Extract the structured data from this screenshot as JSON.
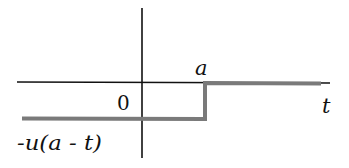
{
  "diagram": {
    "title": "",
    "function_label": "-u(a - t)",
    "origin_label": "0",
    "step_label": "a",
    "x_axis_label": "t",
    "colors": {
      "axis": "#111111",
      "signal": "#7a7a7a",
      "background": "#ffffff"
    },
    "signal": {
      "description": "negative reversed unit step: value -1 for t < a, 0 for t > a",
      "low_value": -1,
      "high_value": 0,
      "step_at": "a"
    }
  }
}
